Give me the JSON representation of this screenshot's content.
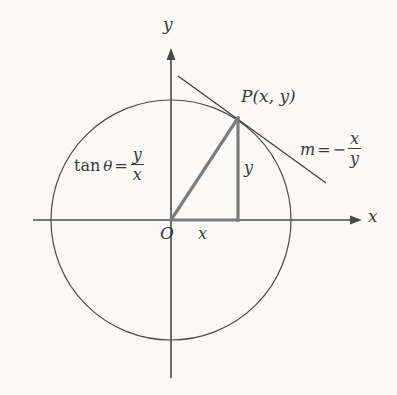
{
  "figure": {
    "background_color": "#fbfaf8",
    "curve_color": "#4a4a4a",
    "triangle_color": "#7c7c7c",
    "text_color": "#3a3a3a"
  },
  "axes": {
    "x_label": "x",
    "y_label": "y",
    "origin_label": "O"
  },
  "point": {
    "label": "P(x, y)"
  },
  "triangle": {
    "horizontal_leg_label": "x",
    "vertical_leg_label": "y"
  },
  "formulas": {
    "tangent": {
      "function": "tan",
      "angle": "θ",
      "equals": "=",
      "numerator": "y",
      "denominator": "x"
    },
    "slope": {
      "variable": "m",
      "equals": "=",
      "sign": "−",
      "numerator": "x",
      "denominator": "y"
    }
  },
  "geometry": {
    "circle": {
      "cx": 171,
      "cy": 220,
      "r": 120
    },
    "point_p": {
      "x": 238,
      "y": 118
    },
    "x_axis": {
      "x1": 33,
      "y1": 220,
      "x2": 362,
      "y2": 220
    },
    "y_axis": {
      "x1": 171,
      "y1": 378,
      "x2": 171,
      "y2": 48
    },
    "tangent_line": {
      "x1": 178,
      "y1": 76,
      "x2": 326,
      "y2": 183
    }
  }
}
